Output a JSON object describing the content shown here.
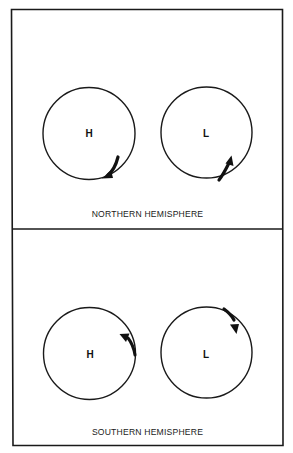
{
  "diagram": {
    "type": "atmospheric circulation around pressure systems",
    "colors": {
      "line": "#1a1a1a",
      "background": "#ffffff"
    },
    "panels": [
      {
        "name": "northern",
        "caption": "NORTHERN HEMISPHERE",
        "systems": [
          {
            "label": "H",
            "meaning": "high pressure",
            "rotation": "clockwise",
            "arrow": "lower-right, pointing down-left"
          },
          {
            "label": "L",
            "meaning": "low pressure",
            "rotation": "counterclockwise",
            "arrow": "lower-right, pointing up-right"
          }
        ]
      },
      {
        "name": "southern",
        "caption": "SOUTHERN HEMISPHERE",
        "systems": [
          {
            "label": "H",
            "meaning": "high pressure",
            "rotation": "counterclockwise",
            "arrow": "right side, pointing up-left"
          },
          {
            "label": "L",
            "meaning": "low pressure",
            "rotation": "clockwise",
            "arrow": "upper-right, pointing down"
          }
        ]
      }
    ]
  }
}
